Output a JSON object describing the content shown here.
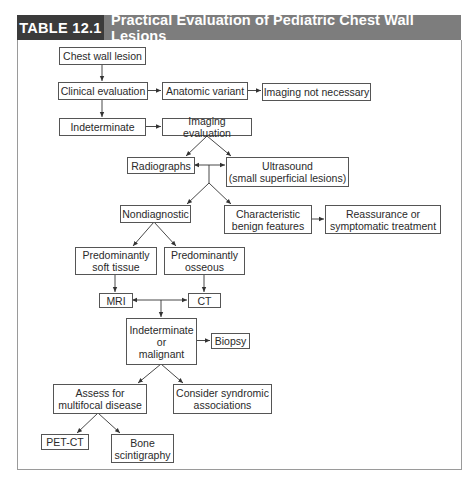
{
  "table": {
    "label": "TABLE 12.1",
    "title": "Practical Evaluation of Pediatric Chest Wall Lesions",
    "colors": {
      "label_bg": "#3b3b3b",
      "title_bg": "#7d7d7d",
      "header_text": "#ffffff",
      "frame_border": "#9a9a9a",
      "node_border": "#555555"
    }
  },
  "flowchart": {
    "nodes": {
      "chest_wall_lesion": "Chest wall lesion",
      "clinical_evaluation": "Clinical evaluation",
      "anatomic_variant": "Anatomic variant",
      "imaging_not_necessary": "Imaging not necessary",
      "indeterminate": "Indeterminate",
      "imaging_evaluation": "Imaging evaluation",
      "radiographs": "Radiographs",
      "ultrasound": "Ultrasound\n(small superficial lesions)",
      "nondiagnostic": "Nondiagnostic",
      "characteristic_benign": "Characteristic\nbenign features",
      "reassurance": "Reassurance or\nsymptomatic treatment",
      "soft_tissue": "Predominantly\nsoft tissue",
      "osseous": "Predominantly\nosseous",
      "mri": "MRI",
      "ct": "CT",
      "indeterminate_malignant": "Indeterminate\nor\nmalignant",
      "biopsy": "Biopsy",
      "multifocal": "Assess for\nmultifocal disease",
      "syndromic": "Consider syndromic\nassociations",
      "pet_ct": "PET-CT",
      "bone_scintigraphy": "Bone\nscintigraphy"
    },
    "edges": [
      [
        "Chest wall lesion",
        "Clinical evaluation"
      ],
      [
        "Clinical evaluation",
        "Anatomic variant"
      ],
      [
        "Anatomic variant",
        "Imaging not necessary"
      ],
      [
        "Clinical evaluation",
        "Indeterminate"
      ],
      [
        "Indeterminate",
        "Imaging evaluation"
      ],
      [
        "Imaging evaluation",
        "Radiographs"
      ],
      [
        "Imaging evaluation",
        "Ultrasound (small superficial lesions)"
      ],
      [
        "Radiographs / Ultrasound",
        "Nondiagnostic"
      ],
      [
        "Radiographs / Ultrasound",
        "Characteristic benign features"
      ],
      [
        "Characteristic benign features",
        "Reassurance or symptomatic treatment"
      ],
      [
        "Nondiagnostic",
        "Predominantly soft tissue"
      ],
      [
        "Nondiagnostic",
        "Predominantly osseous"
      ],
      [
        "Predominantly soft tissue",
        "MRI"
      ],
      [
        "Predominantly osseous",
        "CT"
      ],
      [
        "MRI / CT",
        "Indeterminate or malignant"
      ],
      [
        "Indeterminate or malignant",
        "Biopsy"
      ],
      [
        "Indeterminate or malignant",
        "Assess for multifocal disease"
      ],
      [
        "Indeterminate or malignant",
        "Consider syndromic associations"
      ],
      [
        "Assess for multifocal disease",
        "PET-CT"
      ],
      [
        "Assess for multifocal disease",
        "Bone scintigraphy"
      ]
    ]
  }
}
